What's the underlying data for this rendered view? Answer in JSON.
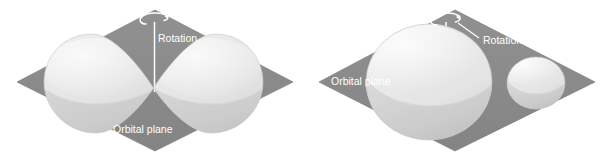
{
  "figure": {
    "type": "diagram",
    "background_color": "#ffffff",
    "panel_count": 2
  },
  "colors": {
    "orbital_plane": "#8a8a8a",
    "orbital_plane_edge": "#7e7e7e",
    "body_light": "#e9e9e9",
    "body_mid": "#d8d8d8",
    "body_shadow": "#c2c2c2",
    "body_terminator": "#cfcfcf",
    "axis_line": "#ffffff",
    "label_text": "#ffffff",
    "leader_line": "#ffffff"
  },
  "panels": [
    {
      "id": "panel-left",
      "name": "contact-binary-panel",
      "plane_label": "Orbital plane",
      "rotation_label": "Rotation",
      "rotation_icon": "rotation-arrow-icon",
      "axis_icon": "rotation-axis-line",
      "bodies": [
        {
          "name": "left-lobe",
          "shape": "teardrop",
          "relative_size": "large"
        },
        {
          "name": "right-lobe",
          "shape": "teardrop",
          "relative_size": "large"
        }
      ],
      "has_leader_line": false
    },
    {
      "id": "panel-right",
      "name": "detached-binary-panel",
      "plane_label": "Orbital plane",
      "rotation_label": "Rotation",
      "rotation_icon": "rotation-arrow-icon",
      "axis_icon": "rotation-axis-line",
      "bodies": [
        {
          "name": "primary-sphere",
          "shape": "sphere",
          "relative_size": "large"
        },
        {
          "name": "companion-sphere",
          "shape": "sphere",
          "relative_size": "small"
        }
      ],
      "has_leader_line": true
    }
  ]
}
